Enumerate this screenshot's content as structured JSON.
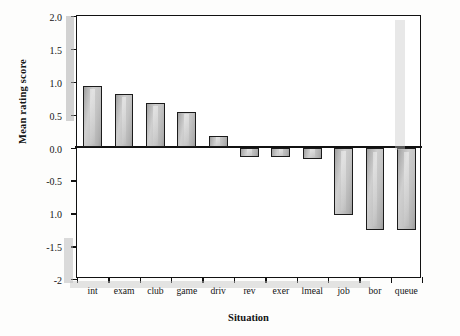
{
  "chart_data": {
    "type": "bar",
    "title": "",
    "xlabel": "Situation",
    "ylabel": "Mean rating score",
    "categories": [
      "int",
      "exam",
      "club",
      "game",
      "driv",
      "rev",
      "exer",
      "lmeal",
      "job",
      "bor",
      "queue"
    ],
    "values": [
      0.94,
      0.82,
      0.67,
      0.54,
      0.18,
      -0.15,
      -0.15,
      -0.17,
      -1.02,
      -1.26,
      -1.26
    ],
    "ylim": [
      -2.0,
      2.0
    ],
    "yticks": [
      2.0,
      1.5,
      1.0,
      0.5,
      0.0,
      -0.5,
      -1.0,
      -1.5,
      -2.0
    ],
    "ytick_labels": [
      "2.0",
      "1.5",
      "1.0",
      "0.5",
      "0.0",
      "-0.5",
      "1.0",
      "-1.5",
      "-2"
    ],
    "grid": false,
    "legend": false,
    "bar_color": "#c0c0c0",
    "bar_edge_color": "#1b1b1b",
    "axis_color": "#111111"
  }
}
